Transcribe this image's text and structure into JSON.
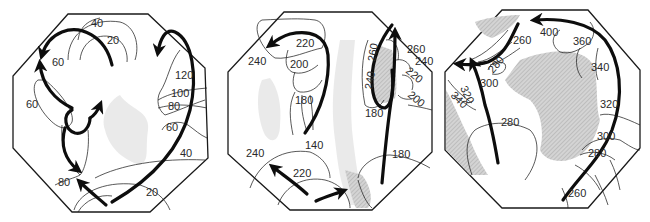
{
  "figure": {
    "panels": [
      {
        "id": "panel-1",
        "contour_labels": [
          "40",
          "20",
          "60",
          "60",
          "120",
          "100",
          "80",
          "60",
          "40",
          "80",
          "20"
        ]
      },
      {
        "id": "panel-2",
        "contour_labels": [
          "220",
          "240",
          "200",
          "180",
          "140",
          "260",
          "240",
          "220",
          "200",
          "180",
          "240",
          "220",
          "180",
          "260",
          "240"
        ]
      },
      {
        "id": "panel-3",
        "contour_labels": [
          "260",
          "400",
          "360",
          "340",
          "280",
          "300",
          "320",
          "340",
          "320",
          "280",
          "300",
          "280",
          "260"
        ]
      }
    ]
  },
  "p1": {
    "l40a": "40",
    "l20a": "20",
    "l60a": "60",
    "l60b": "60",
    "l120": "120",
    "l100": "100",
    "l80a": "80",
    "l60c": "60",
    "l40b": "40",
    "l80b": "80",
    "l20b": "20"
  },
  "p2": {
    "l220a": "220",
    "l240a": "240",
    "l200a": "200",
    "l180a": "180",
    "l140": "140",
    "l260r": "260",
    "l240r": "240",
    "l260": "260",
    "l240b": "240",
    "l220b": "220",
    "l200b": "200",
    "l180b": "180",
    "l240c": "240",
    "l220c": "220",
    "l180c": "180"
  },
  "p3": {
    "l260a": "260",
    "l280a": "280",
    "l300a": "300",
    "l320a": "320",
    "l340a": "340",
    "l400": "400",
    "l360": "360",
    "l340b": "340",
    "l320b": "320",
    "l280b": "280",
    "l300b": "300",
    "l280c": "280",
    "l260b": "260"
  }
}
